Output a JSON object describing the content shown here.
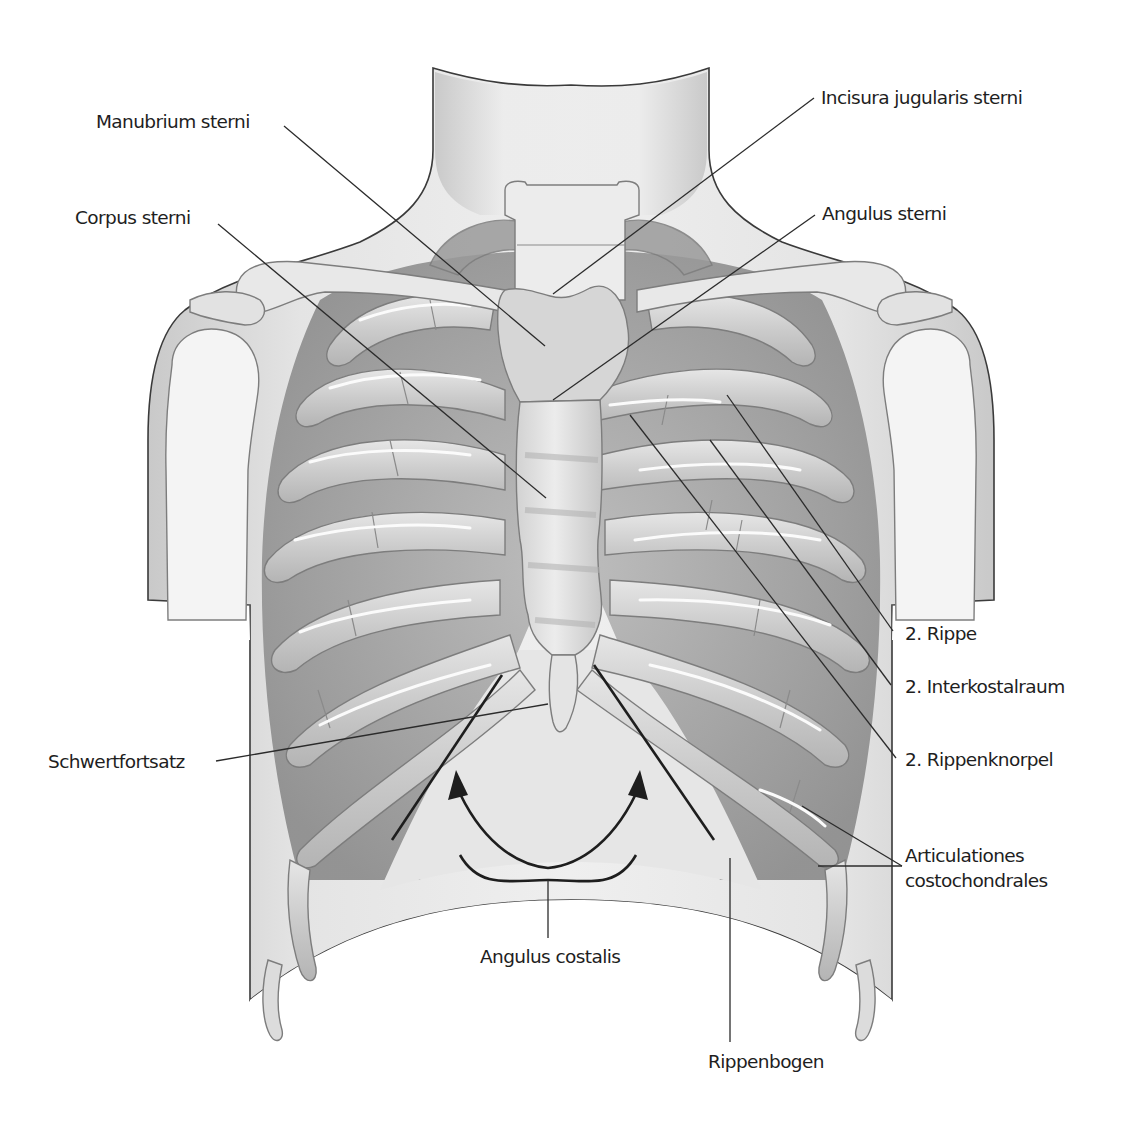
{
  "figure": {
    "type": "anatomical illustration",
    "colors": {
      "background": "#ffffff",
      "skin_light": "#e9e9e9",
      "skin_mid": "#cfcfcf",
      "bone_light": "#dedede",
      "bone_mid": "#c2c2c2",
      "intercostal_dark": "#8f8f8f",
      "highlight": "#fbfbfb",
      "line": "#2b2b2b"
    }
  },
  "labels": {
    "manubrium": "Manubrium sterni",
    "corpus": "Corpus sterni",
    "incisura": "Incisura jugularis sterni",
    "angulus_sterni": "Angulus sterni",
    "rippe": "2. Rippe",
    "interkostalraum": "2. Interkostalraum",
    "rippenknorpel": "2. Rippenknorpel",
    "schwertfortsatz": "Schwertfortsatz",
    "articulationes_line1": "Articulationes",
    "articulationes_line2": "costochondrales",
    "angulus_costalis": "Angulus costalis",
    "rippenbogen": "Rippenbogen"
  }
}
